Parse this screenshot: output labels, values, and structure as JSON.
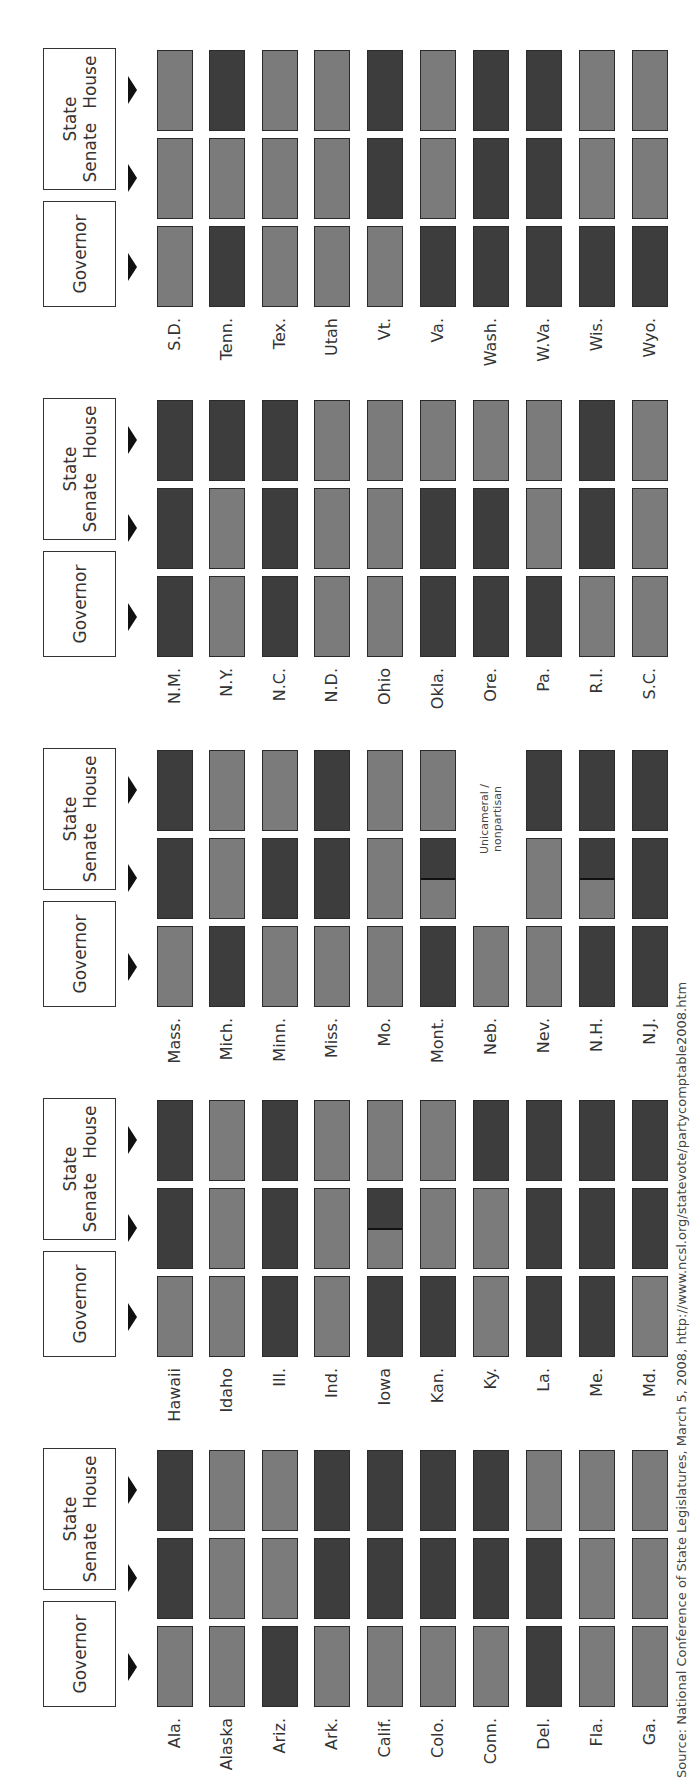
{
  "headers": {
    "governor": "Governor",
    "state": "State",
    "senate": "Senate",
    "house": "House"
  },
  "legend_codes": {
    "D": "dark",
    "L": "light",
    "T": "split (tied)",
    "U": "unicameral / nonpartisan"
  },
  "colors": {
    "dark": "#3d3d3d",
    "light": "#7b7b7b",
    "border": "#2a2a2a"
  },
  "groups": [
    {
      "states": [
        {
          "name": "Ala.",
          "gov": "L",
          "senate": "D",
          "house": "D"
        },
        {
          "name": "Alaska",
          "gov": "L",
          "senate": "L",
          "house": "L"
        },
        {
          "name": "Ariz.",
          "gov": "D",
          "senate": "L",
          "house": "L"
        },
        {
          "name": "Ark.",
          "gov": "L",
          "senate": "D",
          "house": "D"
        },
        {
          "name": "Calif.",
          "gov": "L",
          "senate": "D",
          "house": "D"
        },
        {
          "name": "Colo.",
          "gov": "L",
          "senate": "D",
          "house": "D"
        },
        {
          "name": "Conn.",
          "gov": "L",
          "senate": "D",
          "house": "D"
        },
        {
          "name": "Del.",
          "gov": "D",
          "senate": "D",
          "house": "L"
        },
        {
          "name": "Fla.",
          "gov": "L",
          "senate": "L",
          "house": "L"
        },
        {
          "name": "Ga.",
          "gov": "L",
          "senate": "L",
          "house": "L"
        }
      ]
    },
    {
      "states": [
        {
          "name": "Hawaii",
          "gov": "L",
          "senate": "D",
          "house": "D"
        },
        {
          "name": "Idaho",
          "gov": "L",
          "senate": "L",
          "house": "L"
        },
        {
          "name": "Ill.",
          "gov": "D",
          "senate": "D",
          "house": "D"
        },
        {
          "name": "Ind.",
          "gov": "L",
          "senate": "L",
          "house": "L"
        },
        {
          "name": "Iowa",
          "gov": "D",
          "senate": "T",
          "house": "L"
        },
        {
          "name": "Kan.",
          "gov": "D",
          "senate": "L",
          "house": "L"
        },
        {
          "name": "Ky.",
          "gov": "L",
          "senate": "L",
          "house": "D"
        },
        {
          "name": "La.",
          "gov": "D",
          "senate": "D",
          "house": "D"
        },
        {
          "name": "Me.",
          "gov": "D",
          "senate": "D",
          "house": "D"
        },
        {
          "name": "Md.",
          "gov": "L",
          "senate": "D",
          "house": "D"
        }
      ]
    },
    {
      "states": [
        {
          "name": "Mass.",
          "gov": "L",
          "senate": "D",
          "house": "D"
        },
        {
          "name": "Mich.",
          "gov": "D",
          "senate": "L",
          "house": "L"
        },
        {
          "name": "Minn.",
          "gov": "L",
          "senate": "D",
          "house": "L"
        },
        {
          "name": "Miss.",
          "gov": "L",
          "senate": "D",
          "house": "D"
        },
        {
          "name": "Mo.",
          "gov": "L",
          "senate": "L",
          "house": "L"
        },
        {
          "name": "Mont.",
          "gov": "D",
          "senate": "T",
          "house": "L"
        },
        {
          "name": "Neb.",
          "gov": "L",
          "senate": "U",
          "house": "U"
        },
        {
          "name": "Nev.",
          "gov": "L",
          "senate": "L",
          "house": "D"
        },
        {
          "name": "N.H.",
          "gov": "D",
          "senate": "T",
          "house": "D"
        },
        {
          "name": "N.J.",
          "gov": "D",
          "senate": "D",
          "house": "D"
        }
      ]
    },
    {
      "states": [
        {
          "name": "N.M.",
          "gov": "D",
          "senate": "D",
          "house": "D"
        },
        {
          "name": "N.Y.",
          "gov": "L",
          "senate": "L",
          "house": "D"
        },
        {
          "name": "N.C.",
          "gov": "D",
          "senate": "D",
          "house": "D"
        },
        {
          "name": "N.D.",
          "gov": "L",
          "senate": "L",
          "house": "L"
        },
        {
          "name": "Ohio",
          "gov": "L",
          "senate": "L",
          "house": "L"
        },
        {
          "name": "Okla.",
          "gov": "D",
          "senate": "D",
          "house": "L"
        },
        {
          "name": "Ore.",
          "gov": "D",
          "senate": "D",
          "house": "L"
        },
        {
          "name": "Pa.",
          "gov": "D",
          "senate": "L",
          "house": "L"
        },
        {
          "name": "R.I.",
          "gov": "L",
          "senate": "D",
          "house": "D"
        },
        {
          "name": "S.C.",
          "gov": "L",
          "senate": "L",
          "house": "L"
        }
      ]
    },
    {
      "states": [
        {
          "name": "S.D.",
          "gov": "L",
          "senate": "L",
          "house": "L"
        },
        {
          "name": "Tenn.",
          "gov": "D",
          "senate": "L",
          "house": "D"
        },
        {
          "name": "Tex.",
          "gov": "L",
          "senate": "L",
          "house": "L"
        },
        {
          "name": "Utah",
          "gov": "L",
          "senate": "L",
          "house": "L"
        },
        {
          "name": "Vt.",
          "gov": "L",
          "senate": "D",
          "house": "D"
        },
        {
          "name": "Va.",
          "gov": "D",
          "senate": "L",
          "house": "L"
        },
        {
          "name": "Wash.",
          "gov": "D",
          "senate": "D",
          "house": "D"
        },
        {
          "name": "W.Va.",
          "gov": "D",
          "senate": "D",
          "house": "D"
        },
        {
          "name": "Wis.",
          "gov": "D",
          "senate": "L",
          "house": "L"
        },
        {
          "name": "Wyo.",
          "gov": "D",
          "senate": "L",
          "house": "L"
        }
      ]
    }
  ],
  "notes": {
    "unicameral": "Unicameral /\nnonpartisan"
  },
  "source": "Source: National Conference of State Legislatures, March 5, 2008, http://www.ncsl.org/statevote/partycomptable2008.htm",
  "chart_data": {
    "type": "table",
    "title": "",
    "orientation": "rotated 90° counter-clockwise",
    "columns": [
      "Governor",
      "State Senate",
      "State House"
    ],
    "categories": [
      "Ala.",
      "Alaska",
      "Ariz.",
      "Ark.",
      "Calif.",
      "Colo.",
      "Conn.",
      "Del.",
      "Fla.",
      "Ga.",
      "Hawaii",
      "Idaho",
      "Ill.",
      "Ind.",
      "Iowa",
      "Kan.",
      "Ky.",
      "La.",
      "Me.",
      "Md.",
      "Mass.",
      "Mich.",
      "Minn.",
      "Miss.",
      "Mo.",
      "Mont.",
      "Neb.",
      "Nev.",
      "N.H.",
      "N.J.",
      "N.M.",
      "N.Y.",
      "N.C.",
      "N.D.",
      "Ohio",
      "Okla.",
      "Ore.",
      "Pa.",
      "R.I.",
      "S.C.",
      "S.D.",
      "Tenn.",
      "Tex.",
      "Utah",
      "Vt.",
      "Va.",
      "Wash.",
      "W.Va.",
      "Wis.",
      "Wyo."
    ],
    "series": [
      {
        "name": "Governor",
        "values": [
          "L",
          "L",
          "D",
          "L",
          "L",
          "L",
          "L",
          "D",
          "L",
          "L",
          "L",
          "L",
          "D",
          "L",
          "D",
          "D",
          "L",
          "D",
          "D",
          "L",
          "L",
          "D",
          "L",
          "L",
          "L",
          "D",
          "L",
          "L",
          "D",
          "D",
          "D",
          "L",
          "D",
          "L",
          "L",
          "D",
          "D",
          "D",
          "L",
          "L",
          "L",
          "D",
          "L",
          "L",
          "L",
          "D",
          "D",
          "D",
          "D",
          "D"
        ]
      },
      {
        "name": "State Senate",
        "values": [
          "D",
          "L",
          "L",
          "D",
          "D",
          "D",
          "D",
          "D",
          "L",
          "L",
          "D",
          "L",
          "D",
          "L",
          "T",
          "L",
          "L",
          "D",
          "D",
          "D",
          "D",
          "L",
          "D",
          "D",
          "L",
          "T",
          "U",
          "L",
          "T",
          "D",
          "D",
          "L",
          "D",
          "L",
          "L",
          "D",
          "D",
          "L",
          "D",
          "L",
          "L",
          "L",
          "L",
          "L",
          "D",
          "L",
          "D",
          "D",
          "L",
          "L"
        ]
      },
      {
        "name": "State House",
        "values": [
          "D",
          "L",
          "L",
          "D",
          "D",
          "D",
          "D",
          "L",
          "L",
          "L",
          "D",
          "L",
          "D",
          "L",
          "L",
          "L",
          "D",
          "D",
          "D",
          "D",
          "D",
          "L",
          "L",
          "D",
          "L",
          "L",
          "U",
          "D",
          "D",
          "D",
          "D",
          "D",
          "D",
          "L",
          "L",
          "L",
          "L",
          "L",
          "D",
          "L",
          "L",
          "D",
          "L",
          "L",
          "D",
          "L",
          "D",
          "D",
          "L",
          "L"
        ]
      }
    ],
    "annotations": [
      "Unicameral / nonpartisan (Neb.)",
      "Split bars indicate tied chambers (Iowa, Mont., N.H. senates)"
    ],
    "source": "National Conference of State Legislatures, March 5, 2008"
  }
}
